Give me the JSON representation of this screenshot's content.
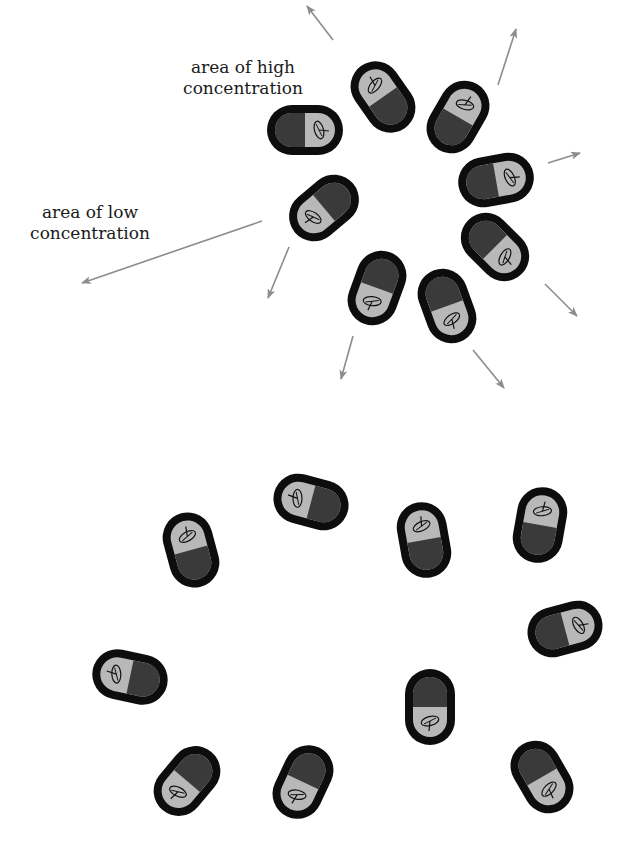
{
  "diagram": {
    "colors": {
      "background": "#ffffff",
      "cell_outer": "#0d0d0d",
      "cell_inner": "#b8b8b8",
      "cell_dark_half": "#3a3a3a",
      "flagellum_stroke": "#111111",
      "arrow": "#8c8c8c",
      "text": "#1a1a1a"
    },
    "labels": {
      "high": {
        "line1": "area of high",
        "line2": "concentration",
        "x": 243,
        "y": 63
      },
      "low": {
        "line1": "area of low",
        "line2": "concentration",
        "x": 90,
        "y": 208
      }
    },
    "top_cluster": {
      "name": "clustered cells at high concentration",
      "cells": [
        {
          "cx": 305,
          "cy": 130,
          "rot": 0
        },
        {
          "cx": 383,
          "cy": 97,
          "rot": -125
        },
        {
          "cx": 458,
          "cy": 117,
          "rot": -60
        },
        {
          "cx": 496,
          "cy": 180,
          "rot": -10
        },
        {
          "cx": 495,
          "cy": 247,
          "rot": 45
        },
        {
          "cx": 324,
          "cy": 208,
          "rot": 140
        },
        {
          "cx": 377,
          "cy": 288,
          "rot": 110
        },
        {
          "cx": 447,
          "cy": 306,
          "rot": 70
        }
      ],
      "arrows": [
        {
          "x1": 333,
          "y1": 40,
          "x2": 307,
          "y2": 6
        },
        {
          "x1": 498,
          "y1": 85,
          "x2": 516,
          "y2": 29
        },
        {
          "x1": 548,
          "y1": 163,
          "x2": 580,
          "y2": 153
        },
        {
          "x1": 545,
          "y1": 284,
          "x2": 577,
          "y2": 316
        },
        {
          "x1": 473,
          "y1": 350,
          "x2": 504,
          "y2": 388
        },
        {
          "x1": 353,
          "y1": 336,
          "x2": 341,
          "y2": 379
        },
        {
          "x1": 289,
          "y1": 247,
          "x2": 268,
          "y2": 298
        },
        {
          "x1": 262,
          "y1": 221,
          "x2": 82,
          "y2": 283
        }
      ]
    },
    "bottom_cluster": {
      "name": "dispersed cells at low concentration",
      "cells": [
        {
          "cx": 311,
          "cy": 502,
          "rot": 195
        },
        {
          "cx": 191,
          "cy": 550,
          "rot": -105
        },
        {
          "cx": 424,
          "cy": 540,
          "rot": -100
        },
        {
          "cx": 540,
          "cy": 525,
          "rot": -80
        },
        {
          "cx": 565,
          "cy": 629,
          "rot": -15
        },
        {
          "cx": 130,
          "cy": 677,
          "rot": 192
        },
        {
          "cx": 430,
          "cy": 707,
          "rot": 90
        },
        {
          "cx": 187,
          "cy": 781,
          "rot": 130
        },
        {
          "cx": 303,
          "cy": 782,
          "rot": 115
        },
        {
          "cx": 542,
          "cy": 777,
          "rot": 60
        }
      ]
    }
  }
}
